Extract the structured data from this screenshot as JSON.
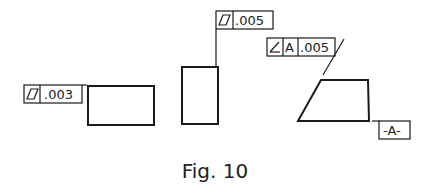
{
  "figure": {
    "caption": "Fig. 10",
    "feature_control_frames": [
      {
        "id": "flatness-left",
        "symbol": "flatness",
        "tolerance": ".003"
      },
      {
        "id": "flatness-top",
        "symbol": "flatness",
        "tolerance": ".005"
      },
      {
        "id": "angularity",
        "symbol": "angularity",
        "datum": "A",
        "tolerance": ".005"
      }
    ],
    "datum_feature": {
      "label": "-A-"
    },
    "shapes": [
      "rectangle",
      "tall-rectangle",
      "trapezoid"
    ]
  }
}
